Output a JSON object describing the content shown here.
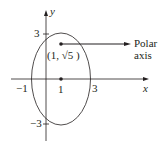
{
  "diagram": {
    "type": "polar-coordinate-ellipse",
    "colors": {
      "stroke": "#231f20",
      "background": "#ffffff"
    },
    "axes": {
      "x_label": "x",
      "y_label": "y"
    },
    "ticks": {
      "x": [
        {
          "value": -1,
          "label": "−1"
        },
        {
          "value": 1,
          "label": "1"
        },
        {
          "value": 3,
          "label": "3"
        }
      ],
      "y": [
        {
          "value": 3,
          "label": "3"
        },
        {
          "value": -3,
          "label": "−3"
        }
      ]
    },
    "ellipse": {
      "center": [
        1,
        0
      ],
      "semi_x": 2,
      "semi_y": 3
    },
    "points": [
      {
        "name": "focus",
        "coords": [
          1,
          2.236
        ],
        "label": "(1, √5 )"
      },
      {
        "name": "center",
        "coords": [
          1,
          0
        ]
      }
    ],
    "annotation": {
      "line1": "Polar",
      "line2": "axis"
    }
  }
}
